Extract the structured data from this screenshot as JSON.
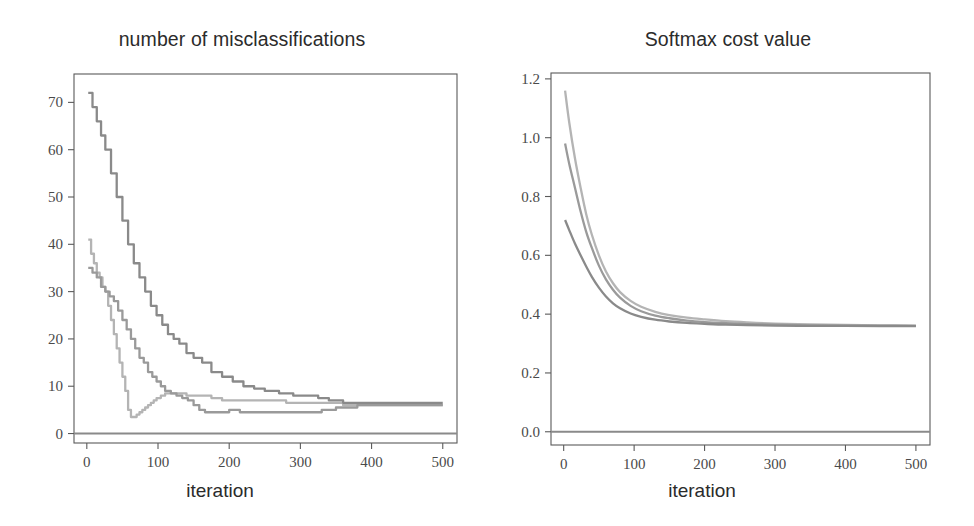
{
  "figure": {
    "width": 974,
    "height": 526,
    "background": "#ffffff"
  },
  "panels": [
    {
      "id": "misclassifications",
      "title": "number of misclassifications",
      "xlabel": "iteration"
    },
    {
      "id": "softmax-cost",
      "title": "Softmax cost value",
      "xlabel": "iteration"
    }
  ],
  "chart_data": [
    {
      "type": "line",
      "title": "number of misclassifications",
      "xlabel": "iteration",
      "ylabel": "",
      "xlim": [
        -18,
        520
      ],
      "ylim": [
        -2,
        76
      ],
      "xticks": [
        0,
        100,
        200,
        300,
        400,
        500
      ],
      "xticklabels": [
        "0",
        "100",
        "200",
        "300",
        "400",
        "500"
      ],
      "yticks": [
        0,
        10,
        20,
        30,
        40,
        50,
        60,
        70
      ],
      "yticklabels": [
        "0",
        "10",
        "20",
        "30",
        "40",
        "50",
        "60",
        "70"
      ],
      "grid": false,
      "legend": null,
      "series": [
        {
          "name": "run-1",
          "color": "#b4b4b4",
          "style": "step",
          "x": [
            2,
            6,
            10,
            14,
            18,
            22,
            26,
            30,
            34,
            38,
            42,
            46,
            50,
            54,
            58,
            62,
            66,
            70,
            74,
            78,
            82,
            86,
            90,
            94,
            98,
            104,
            110,
            116,
            122,
            130,
            140,
            150,
            160,
            175,
            190,
            205,
            225,
            250,
            280,
            320,
            360,
            400,
            440,
            480,
            500
          ],
          "y": [
            41,
            38,
            36,
            34,
            33,
            31,
            30,
            27,
            24,
            21,
            18,
            15,
            12,
            9,
            5,
            3.5,
            3.5,
            4,
            4.5,
            5,
            5.5,
            6,
            6.5,
            7,
            7.5,
            8,
            8.5,
            8.5,
            8.5,
            8.5,
            8,
            8,
            8,
            7.5,
            7,
            7,
            7,
            7,
            6.5,
            6.5,
            6,
            6,
            6,
            6,
            6
          ]
        },
        {
          "name": "run-2",
          "color": "#9a9a9a",
          "style": "step",
          "x": [
            2,
            8,
            14,
            20,
            26,
            32,
            38,
            44,
            50,
            56,
            62,
            68,
            74,
            80,
            86,
            92,
            98,
            104,
            110,
            118,
            126,
            134,
            142,
            150,
            158,
            166,
            176,
            188,
            200,
            215,
            230,
            250,
            270,
            290,
            310,
            330,
            350,
            380,
            410,
            450,
            500
          ],
          "y": [
            35,
            34,
            33,
            31,
            30,
            29,
            28,
            26,
            24,
            22,
            20,
            18,
            16,
            15,
            13,
            12,
            11,
            10,
            9,
            8.5,
            8,
            7.5,
            7,
            6,
            5,
            4.5,
            4.5,
            4.5,
            5,
            4.5,
            4.5,
            4.5,
            4.5,
            4.5,
            4.5,
            5,
            5.5,
            6,
            6,
            6,
            6
          ]
        },
        {
          "name": "run-3",
          "color": "#8a8a8a",
          "style": "step",
          "x": [
            2,
            8,
            14,
            20,
            26,
            34,
            42,
            50,
            58,
            66,
            74,
            82,
            90,
            98,
            106,
            114,
            122,
            130,
            140,
            150,
            162,
            175,
            190,
            205,
            220,
            235,
            250,
            270,
            290,
            310,
            325,
            340,
            360,
            390,
            420,
            460,
            500
          ],
          "y": [
            72,
            69,
            66,
            63,
            60,
            55,
            50,
            45,
            40,
            36,
            33,
            30,
            27,
            25,
            23,
            21,
            20,
            19,
            17,
            16,
            15,
            13,
            12,
            11,
            10,
            9.5,
            9,
            8.5,
            8,
            8,
            7.5,
            7,
            6.5,
            6.5,
            6.5,
            6.5,
            6.5
          ]
        }
      ],
      "baseline": {
        "y": 0,
        "color": "#8a8a8a"
      }
    },
    {
      "type": "line",
      "title": "Softmax cost value",
      "xlabel": "iteration",
      "ylabel": "",
      "xlim": [
        -18,
        520
      ],
      "ylim": [
        -0.045,
        1.22
      ],
      "xticks": [
        0,
        100,
        200,
        300,
        400,
        500
      ],
      "xticklabels": [
        "0",
        "100",
        "200",
        "300",
        "400",
        "500"
      ],
      "yticks": [
        0.0,
        0.2,
        0.4,
        0.6,
        0.8,
        1.0,
        1.2
      ],
      "yticklabels": [
        "0.0",
        "0.2",
        "0.4",
        "0.6",
        "0.8",
        "1.0",
        "1.2"
      ],
      "grid": false,
      "legend": null,
      "series": [
        {
          "name": "run-1",
          "color": "#b4b4b4",
          "style": "smooth",
          "x": [
            2,
            8,
            16,
            24,
            32,
            40,
            50,
            60,
            70,
            80,
            95,
            110,
            130,
            150,
            175,
            200,
            230,
            260,
            300,
            350,
            400,
            450,
            500
          ],
          "y": [
            1.16,
            1.05,
            0.93,
            0.83,
            0.74,
            0.67,
            0.6,
            0.545,
            0.505,
            0.475,
            0.445,
            0.425,
            0.408,
            0.397,
            0.388,
            0.382,
            0.376,
            0.372,
            0.368,
            0.365,
            0.363,
            0.362,
            0.361
          ]
        },
        {
          "name": "run-2",
          "color": "#9a9a9a",
          "style": "smooth",
          "x": [
            2,
            8,
            16,
            24,
            32,
            40,
            50,
            60,
            70,
            80,
            95,
            110,
            130,
            150,
            175,
            200,
            230,
            260,
            300,
            350,
            400,
            450,
            500
          ],
          "y": [
            0.98,
            0.91,
            0.83,
            0.75,
            0.68,
            0.625,
            0.565,
            0.518,
            0.483,
            0.456,
            0.428,
            0.41,
            0.395,
            0.386,
            0.378,
            0.373,
            0.369,
            0.366,
            0.364,
            0.362,
            0.361,
            0.361,
            0.36
          ]
        },
        {
          "name": "run-3",
          "color": "#8a8a8a",
          "style": "smooth",
          "x": [
            2,
            8,
            16,
            24,
            32,
            40,
            50,
            60,
            70,
            80,
            95,
            110,
            130,
            150,
            175,
            200,
            230,
            260,
            300,
            350,
            400,
            450,
            500
          ],
          "y": [
            0.72,
            0.685,
            0.64,
            0.6,
            0.562,
            0.527,
            0.49,
            0.46,
            0.437,
            0.42,
            0.402,
            0.391,
            0.381,
            0.375,
            0.37,
            0.367,
            0.364,
            0.363,
            0.361,
            0.36,
            0.36,
            0.359,
            0.359
          ]
        }
      ],
      "baseline": {
        "y": 0.0,
        "color": "#8a8a8a"
      }
    }
  ],
  "style": {
    "axis_color": "#5a5a5a",
    "tick_label_color": "#4a4a4a",
    "title_color": "#2b2b2b"
  }
}
